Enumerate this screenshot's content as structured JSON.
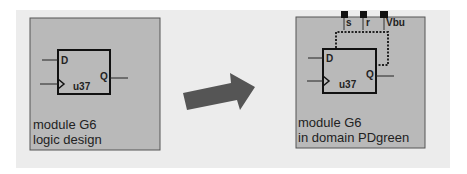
{
  "colors": {
    "panel": "#ececec",
    "module_fill": "#b9b9b9",
    "module_border": "#555555",
    "arrow": "#555555",
    "line": "#222222"
  },
  "left_module": {
    "flipflop": {
      "d": "D",
      "q": "Q",
      "instance": "u37"
    },
    "caption_line1": "module  G6",
    "caption_line2": "logic design"
  },
  "right_module": {
    "flipflop": {
      "d": "D",
      "q": "Q",
      "instance": "u37"
    },
    "pins": [
      "s",
      "r",
      "Vbu"
    ],
    "caption_line1": "module  G6",
    "caption_line2": "in domain PDgreen"
  },
  "arrow": {
    "icon": "right-arrow-icon"
  }
}
